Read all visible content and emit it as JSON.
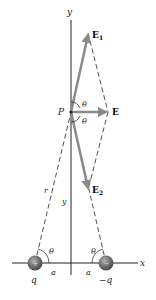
{
  "diagram": {
    "axes": {
      "x_label": "x",
      "y_label": "y"
    },
    "point": {
      "label": "P"
    },
    "vectors": [
      {
        "name": "E1",
        "label": "E",
        "subscript": "1"
      },
      {
        "name": "E",
        "label": "E",
        "subscript": ""
      },
      {
        "name": "E2",
        "label": "E",
        "subscript": "2"
      }
    ],
    "angles": {
      "theta": "θ"
    },
    "distances": {
      "r": "r",
      "y": "y",
      "a_left": "a",
      "a_right": "a"
    },
    "charges": [
      {
        "name": "positive-charge",
        "label": "q",
        "sign": "+"
      },
      {
        "name": "negative-charge",
        "label": "−q",
        "sign": "−"
      }
    ],
    "colors": {
      "vector": "#8a8a8a",
      "line": "#222222",
      "charge": "#6b6b6b"
    }
  }
}
